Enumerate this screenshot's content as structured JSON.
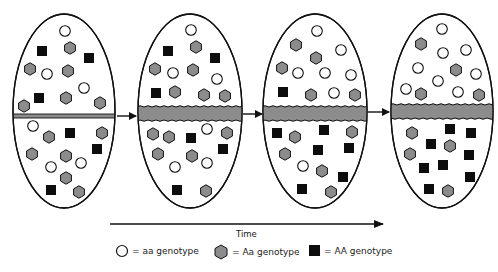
{
  "colors": {
    "outline": "#111111",
    "hex_fill": "#8c8c8c",
    "square_fill": "#0d0d0d",
    "circle_fill": "#ffffff",
    "barrier_fill": "#8c8c8c"
  },
  "axis": {
    "time_label": "Time"
  },
  "legend": {
    "items": [
      {
        "shape": "circle",
        "label": "= aa genotype"
      },
      {
        "shape": "hexagon",
        "label": "= Aa genotype"
      },
      {
        "shape": "square",
        "label": "= AA genotype"
      }
    ]
  },
  "populations": [
    {
      "name": "stage-1",
      "ellipse": {
        "cx": 64,
        "cy": 111,
        "rx": 51,
        "ry": 97
      },
      "barrier": {
        "y": 114,
        "h": 4,
        "type": "thin"
      },
      "organisms": [
        [
          "c",
          65,
          31
        ],
        [
          "h",
          70,
          48
        ],
        [
          "s",
          42,
          51
        ],
        [
          "s",
          89,
          58
        ],
        [
          "h",
          30,
          69
        ],
        [
          "c",
          47,
          74
        ],
        [
          "h",
          68,
          71
        ],
        [
          "c",
          84,
          88
        ],
        [
          "s",
          39,
          98
        ],
        [
          "h",
          66,
          98
        ],
        [
          "h",
          24,
          106
        ],
        [
          "h",
          100,
          103
        ],
        [
          "c",
          33,
          126
        ],
        [
          "h",
          49,
          137
        ],
        [
          "s",
          70,
          133
        ],
        [
          "h",
          102,
          133
        ],
        [
          "s",
          97,
          149
        ],
        [
          "h",
          32,
          154
        ],
        [
          "h",
          66,
          156
        ],
        [
          "c",
          51,
          167
        ],
        [
          "c",
          81,
          163
        ],
        [
          "h",
          66,
          178
        ],
        [
          "s",
          51,
          190
        ],
        [
          "h",
          79,
          192
        ]
      ]
    },
    {
      "name": "stage-2",
      "ellipse": {
        "cx": 190,
        "cy": 111,
        "rx": 52,
        "ry": 97
      },
      "barrier": {
        "y": 107,
        "h": 13,
        "type": "thick"
      },
      "organisms": [
        [
          "c",
          191,
          30
        ],
        [
          "h",
          196,
          47
        ],
        [
          "s",
          168,
          51
        ],
        [
          "s",
          215,
          58
        ],
        [
          "h",
          155,
          69
        ],
        [
          "c",
          173,
          73
        ],
        [
          "h",
          193,
          70
        ],
        [
          "c",
          217,
          79
        ],
        [
          "s",
          156,
          93
        ],
        [
          "h",
          175,
          92
        ],
        [
          "h",
          204,
          95
        ],
        [
          "h",
          225,
          96
        ],
        [
          "h",
          153,
          134
        ],
        [
          "h",
          169,
          137
        ],
        [
          "s",
          191,
          138
        ],
        [
          "c",
          207,
          129
        ],
        [
          "h",
          227,
          133
        ],
        [
          "s",
          223,
          149
        ],
        [
          "h",
          158,
          154
        ],
        [
          "h",
          192,
          156
        ],
        [
          "c",
          175,
          167
        ],
        [
          "c",
          207,
          163
        ],
        [
          "s",
          177,
          190
        ],
        [
          "h",
          206,
          191
        ]
      ]
    },
    {
      "name": "stage-3",
      "ellipse": {
        "cx": 315,
        "cy": 111,
        "rx": 52,
        "ry": 97
      },
      "barrier": {
        "y": 107,
        "h": 13,
        "type": "thick"
      },
      "organisms": [
        [
          "c",
          317,
          31
        ],
        [
          "h",
          296,
          45
        ],
        [
          "h",
          316,
          58
        ],
        [
          "c",
          341,
          50
        ],
        [
          "h",
          282,
          68
        ],
        [
          "c",
          298,
          73
        ],
        [
          "c",
          325,
          73
        ],
        [
          "c",
          351,
          75
        ],
        [
          "s",
          283,
          92
        ],
        [
          "h",
          311,
          95
        ],
        [
          "c",
          334,
          93
        ],
        [
          "h",
          355,
          95
        ],
        [
          "s",
          277,
          133
        ],
        [
          "h",
          295,
          137
        ],
        [
          "s",
          324,
          130
        ],
        [
          "h",
          352,
          132
        ],
        [
          "s",
          318,
          150
        ],
        [
          "s",
          349,
          148
        ],
        [
          "h",
          285,
          154
        ],
        [
          "c",
          303,
          166
        ],
        [
          "h",
          322,
          171
        ],
        [
          "s",
          343,
          177
        ],
        [
          "s",
          302,
          189
        ],
        [
          "h",
          331,
          192
        ]
      ]
    },
    {
      "name": "stage-4",
      "ellipse": {
        "cx": 442,
        "cy": 111,
        "rx": 51,
        "ry": 97
      },
      "barrier": {
        "y": 105,
        "h": 13,
        "type": "thick"
      },
      "organisms": [
        [
          "c",
          442,
          29
        ],
        [
          "h",
          421,
          44
        ],
        [
          "c",
          443,
          53
        ],
        [
          "c",
          466,
          50
        ],
        [
          "c",
          418,
          68
        ],
        [
          "h",
          456,
          70
        ],
        [
          "c",
          476,
          74
        ],
        [
          "c",
          438,
          81
        ],
        [
          "c",
          406,
          89
        ],
        [
          "h",
          421,
          94
        ],
        [
          "c",
          458,
          92
        ],
        [
          "h",
          479,
          95
        ],
        [
          "h",
          412,
          133
        ],
        [
          "s",
          450,
          129
        ],
        [
          "s",
          471,
          133
        ],
        [
          "s",
          431,
          144
        ],
        [
          "h",
          450,
          146
        ],
        [
          "h",
          410,
          154
        ],
        [
          "s",
          469,
          155
        ],
        [
          "s",
          424,
          168
        ],
        [
          "s",
          443,
          165
        ],
        [
          "s",
          470,
          177
        ],
        [
          "s",
          429,
          189
        ],
        [
          "h",
          448,
          191
        ]
      ]
    }
  ],
  "stage_arrows": [
    {
      "x1": 117,
      "x2": 136,
      "y": 116
    },
    {
      "x1": 243,
      "x2": 262,
      "y": 114
    },
    {
      "x1": 368,
      "x2": 389,
      "y": 112
    }
  ],
  "time_arrow": {
    "x1": 110,
    "x2": 383,
    "y": 224
  }
}
